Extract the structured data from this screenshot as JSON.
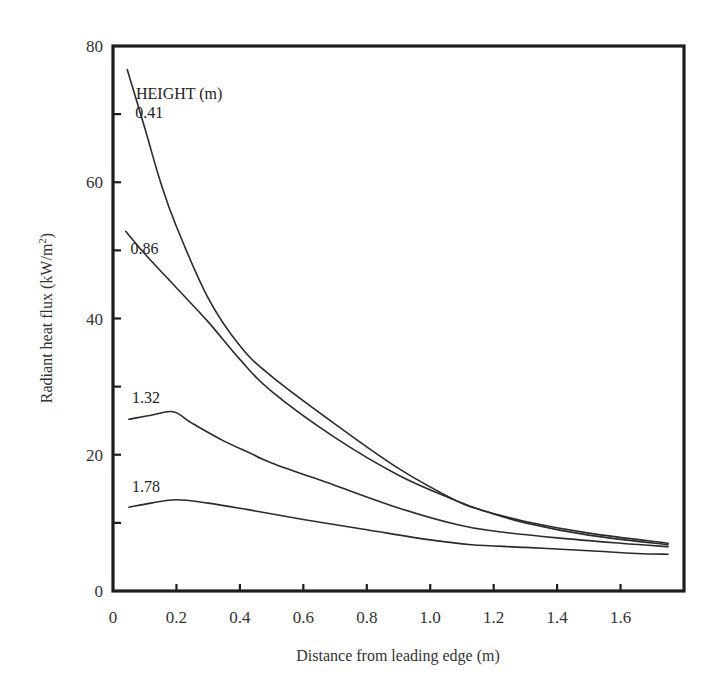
{
  "chart_data": {
    "type": "line",
    "title": "",
    "xlabel": "Distance from leading edge (m)",
    "ylabel": "Radiant heat flux (kW/m²)",
    "ylabel_parts": {
      "main": "Radiant heat flux (kW/m",
      "sup": "2",
      "close": ")"
    },
    "xlim": [
      0,
      1.8
    ],
    "ylim": [
      0,
      80
    ],
    "grid": false,
    "legend_title": "HEIGHT (m)",
    "x_ticks": [
      0,
      0.2,
      0.4,
      0.6,
      0.8,
      1.0,
      1.2,
      1.4,
      1.6
    ],
    "x_tick_labels": [
      "0",
      "0.2",
      "0.4",
      "0.6",
      "0.8",
      "1.0",
      "1.2",
      "1.4",
      "1.6"
    ],
    "y_ticks_major": [
      0,
      20,
      40,
      60,
      80
    ],
    "y_tick_labels": [
      "0",
      "20",
      "40",
      "60",
      "80"
    ],
    "y_ticks_minor": [
      10,
      30,
      50,
      70
    ],
    "series": [
      {
        "name": "0.41",
        "label_pos": [
          0.07,
          69.5
        ],
        "points": [
          [
            0.045,
            76.5
          ],
          [
            0.1,
            68
          ],
          [
            0.15,
            60
          ],
          [
            0.2,
            53.5
          ],
          [
            0.3,
            43
          ],
          [
            0.4,
            36
          ],
          [
            0.5,
            31.5
          ],
          [
            0.7,
            24.5
          ],
          [
            0.9,
            18
          ],
          [
            1.08,
            13.3
          ],
          [
            1.16,
            11.9
          ],
          [
            1.3,
            10.2
          ],
          [
            1.5,
            8.5
          ],
          [
            1.75,
            7.0
          ]
        ]
      },
      {
        "name": "0.86",
        "label_pos": [
          0.055,
          49.5
        ],
        "points": [
          [
            0.04,
            52.8
          ],
          [
            0.1,
            49.5
          ],
          [
            0.2,
            44.5
          ],
          [
            0.3,
            39.5
          ],
          [
            0.4,
            34
          ],
          [
            0.5,
            29.3
          ],
          [
            0.7,
            22.5
          ],
          [
            0.9,
            17
          ],
          [
            1.08,
            13.3
          ],
          [
            1.16,
            11.9
          ],
          [
            1.3,
            10.0
          ],
          [
            1.5,
            8.2
          ],
          [
            1.75,
            6.8
          ]
        ]
      },
      {
        "name": "1.32",
        "label_pos": [
          0.06,
          27.6
        ],
        "points": [
          [
            0.05,
            25.2
          ],
          [
            0.12,
            25.8
          ],
          [
            0.19,
            26.3
          ],
          [
            0.25,
            24.6
          ],
          [
            0.35,
            22
          ],
          [
            0.43,
            20.3
          ],
          [
            0.5,
            18.8
          ],
          [
            0.7,
            15.5
          ],
          [
            0.9,
            12.2
          ],
          [
            1.08,
            9.8
          ],
          [
            1.2,
            8.8
          ],
          [
            1.4,
            7.8
          ],
          [
            1.6,
            7.0
          ],
          [
            1.75,
            6.5
          ]
        ]
      },
      {
        "name": "1.78",
        "label_pos": [
          0.06,
          14.6
        ],
        "points": [
          [
            0.05,
            12.3
          ],
          [
            0.12,
            12.9
          ],
          [
            0.2,
            13.4
          ],
          [
            0.3,
            12.9
          ],
          [
            0.43,
            11.9
          ],
          [
            0.6,
            10.5
          ],
          [
            0.8,
            9.0
          ],
          [
            1.0,
            7.5
          ],
          [
            1.13,
            6.8
          ],
          [
            1.3,
            6.4
          ],
          [
            1.5,
            5.9
          ],
          [
            1.65,
            5.5
          ],
          [
            1.75,
            5.4
          ]
        ]
      }
    ]
  }
}
